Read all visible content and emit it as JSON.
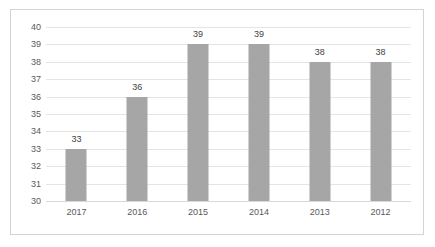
{
  "chart_data": {
    "type": "bar",
    "title": "",
    "subtitle": "",
    "xlabel": "",
    "ylabel": "",
    "categories": [
      "2017",
      "2016",
      "2015",
      "2014",
      "2013",
      "2012"
    ],
    "values": [
      33,
      36,
      39,
      39,
      38,
      38
    ],
    "data_labels": [
      "33",
      "36",
      "39",
      "39",
      "38",
      "38"
    ],
    "ylim": [
      30,
      40
    ],
    "ytick_step": 1,
    "ytick_labels": [
      "40",
      "39",
      "38",
      "37",
      "36",
      "35",
      "34",
      "33",
      "32",
      "31",
      "30"
    ],
    "grid": true,
    "grid_axis": "y",
    "legend": false,
    "legend_position": "none",
    "colors": {
      "bar": "#a6a6a6",
      "gridline": "#e4e4e4",
      "axis": "#d9d9d9",
      "border": "#d4d4d4",
      "tick_text": "#59595b",
      "label_text": "#3f3f41",
      "background": "#ffffff"
    }
  }
}
